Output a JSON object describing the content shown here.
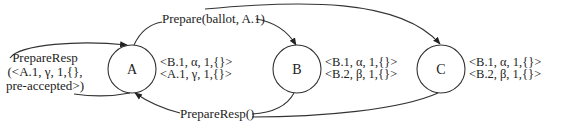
{
  "diagram": {
    "type": "message-flow",
    "nodes": [
      {
        "id": "A",
        "label": "A",
        "cx": 132,
        "cy": 69,
        "r": 24,
        "state": [
          "<B.1, α, 1,{}>",
          "<A.1, γ, 1,{}>"
        ]
      },
      {
        "id": "B",
        "label": "B",
        "cx": 297,
        "cy": 69,
        "r": 24,
        "state": [
          "<B.1, α, 1,{}>",
          "<B.2, β, 1,{}>"
        ]
      },
      {
        "id": "C",
        "label": "C",
        "cx": 441,
        "cy": 69,
        "r": 24,
        "state": [
          "<B.1, α, 1,{}>",
          "<B.2, β, 1,{}>"
        ]
      }
    ],
    "edges": [
      {
        "from": "A",
        "to": "B",
        "label": "Prepare(ballot, A.1)"
      },
      {
        "from": "A",
        "to": "C",
        "label": "Prepare(ballot, A.1)"
      },
      {
        "from": "B",
        "to": "A",
        "label": "PrepareResp()"
      },
      {
        "from": "C",
        "to": "A",
        "label": "PrepareResp()"
      },
      {
        "from": "A",
        "to": "A",
        "label_lines": [
          "PrepareResp",
          "(<A.1, γ, 1,{},",
          "pre-accepted>)"
        ]
      }
    ],
    "labels": {
      "prepare": "Prepare(ballot, A.1)",
      "prepare_resp": "PrepareResp()",
      "self_resp_line1": "PrepareResp",
      "self_resp_line2": "(<A.1, γ, 1,{},",
      "self_resp_line3": "pre-accepted>)"
    },
    "colors": {
      "stroke": "#333333",
      "text": "#222222",
      "background": "#ffffff"
    }
  }
}
